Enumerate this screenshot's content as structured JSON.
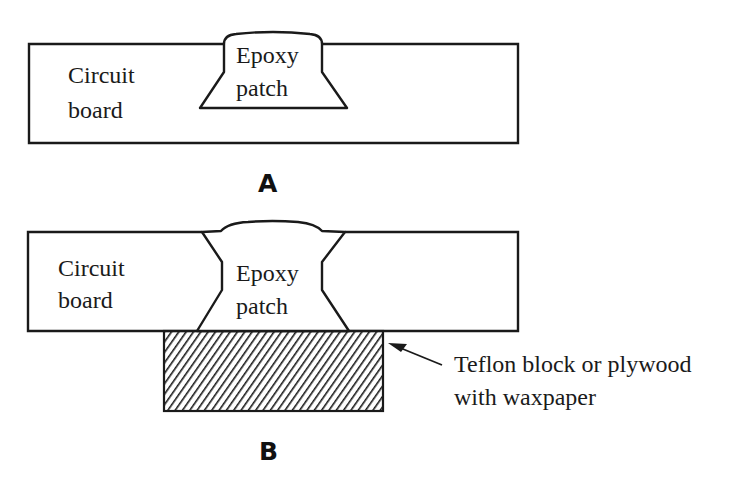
{
  "figure": {
    "panels": [
      {
        "id": "A",
        "label": "A",
        "board_label_line1": "Circuit",
        "board_label_line2": "board",
        "patch_label_line1": "Epoxy",
        "patch_label_line2": "patch"
      },
      {
        "id": "B",
        "label": "B",
        "board_label_line1": "Circuit",
        "board_label_line2": "board",
        "patch_label_line1": "Epoxy",
        "patch_label_line2": "patch",
        "block_callout_line1": "Teflon block or plywood",
        "block_callout_line2": "with waxpaper"
      }
    ],
    "colors": {
      "stroke": "#1a1a1a",
      "background": "#ffffff"
    }
  }
}
